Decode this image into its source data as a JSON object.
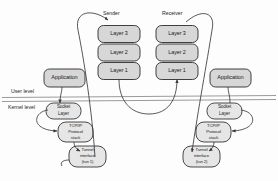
{
  "diagram": {
    "colors": {
      "box_fill": "#d7d7d7",
      "box_fill_light": "#e6e6e6",
      "box_stroke": "#2b2b2b",
      "line": "#3a3a3a",
      "divider": "#8f8f8f",
      "text": "#1b1b1b",
      "background": "#fdfdfd"
    },
    "roles": {
      "sender": "Sender",
      "receiver": "Receiver"
    },
    "levels": {
      "user": "User level",
      "kernel": "Kernel level"
    },
    "sender_stack": [
      {
        "label": "Layer 3"
      },
      {
        "label": "Layer 2"
      },
      {
        "label": "Layer 1"
      }
    ],
    "receiver_stack": [
      {
        "label": "Layer 3"
      },
      {
        "label": "Layer 2"
      },
      {
        "label": "Layer 1"
      }
    ],
    "left_host": {
      "application": "Application",
      "socket_line1": "Socket",
      "socket_line2": "Layer",
      "tcpip_line1": "TCP/IP",
      "tcpip_line2": "Protocol",
      "tcpip_line3": "stack",
      "tunnel_line1": "Tunnel",
      "tunnel_line2": "interface",
      "tunnel_line3": "(tun 1)"
    },
    "right_host": {
      "application": "Application",
      "socket_line1": "Socket",
      "socket_line2": "Layer",
      "tcpip_line1": "TCP/IP",
      "tcpip_line2": "Protocol",
      "tcpip_line3": "stack",
      "tunnel_line1": "Tunnel",
      "tunnel_line2": "interface",
      "tunnel_line3": "(tun 2)"
    }
  }
}
